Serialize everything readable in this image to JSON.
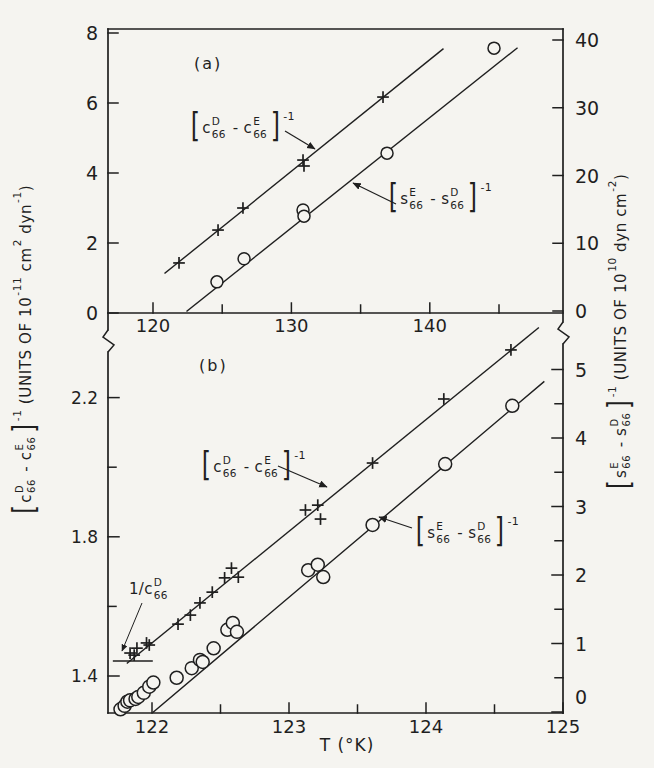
{
  "colors": {
    "paper": "#f5f4f0",
    "ink": "#1f1f1f"
  },
  "titles": {
    "x_axis": "T (°K)",
    "panel_a": "(a)",
    "panel_b": "(b)"
  },
  "formulas": {
    "c_inverse": [
      {
        "br": "["
      },
      {
        "t": "c"
      },
      {
        "stk": [
          "D",
          "66"
        ]
      },
      {
        "t": " - "
      },
      {
        "t": "c"
      },
      {
        "stk": [
          "E",
          "66"
        ]
      },
      {
        "br": "]"
      },
      {
        "sup": "-1"
      }
    ],
    "s_inverse": [
      {
        "br": "["
      },
      {
        "t": "s"
      },
      {
        "stk": [
          "E",
          "66"
        ]
      },
      {
        "t": " - "
      },
      {
        "t": "s"
      },
      {
        "stk": [
          "D",
          "66"
        ]
      },
      {
        "br": "]"
      },
      {
        "sup": "-1"
      }
    ],
    "intercept": [
      {
        "t": "1/c"
      },
      {
        "stk": [
          "D",
          "66"
        ]
      }
    ],
    "left_axis_title": [
      {
        "br": "["
      },
      {
        "t": "c"
      },
      {
        "stk": [
          "D",
          "66"
        ]
      },
      {
        "t": " - "
      },
      {
        "t": "c"
      },
      {
        "stk": [
          "E",
          "66"
        ]
      },
      {
        "br": "]"
      },
      {
        "sup": "-1"
      },
      {
        "t": " (UNITS OF 10"
      },
      {
        "sup": "-11"
      },
      {
        "t": " cm"
      },
      {
        "sup": "2"
      },
      {
        "t": " dyn"
      },
      {
        "sup": "-1"
      },
      {
        "t": ")"
      }
    ],
    "right_axis_title": [
      {
        "br": "["
      },
      {
        "t": "s"
      },
      {
        "stk": [
          "E",
          "66"
        ]
      },
      {
        "t": " - "
      },
      {
        "t": "s"
      },
      {
        "stk": [
          "D",
          "66"
        ]
      },
      {
        "br": "]"
      },
      {
        "sup": "-1"
      },
      {
        "t": " (UNITS OF 10"
      },
      {
        "sup": "10"
      },
      {
        "t": " dyn cm"
      },
      {
        "sup": "-2"
      },
      {
        "t": ")"
      }
    ]
  },
  "chart_data": [
    {
      "panel": "a",
      "type": "scatter",
      "x_label": "T (°K)",
      "x_range": [
        116.8,
        149.6
      ],
      "x_ticks": {
        "major": [
          120,
          130,
          140
        ],
        "labels": [
          "120",
          "130",
          "140"
        ],
        "minor": [
          125,
          135,
          145
        ]
      },
      "left_axis": {
        "quantity": "(c66D - c66E)^-1",
        "units": "10^-11 cm^2 dyn^-1",
        "range": [
          0,
          8.1
        ],
        "ticks": [
          0,
          2,
          4,
          6,
          8
        ],
        "labels": [
          "0",
          "2",
          "4",
          "6",
          "8"
        ],
        "minor": []
      },
      "right_axis": {
        "quantity": "(s66E - s66D)^-1",
        "units": "10^10 dyn cm^-2",
        "range": [
          0,
          41.6
        ],
        "ticks": [
          0,
          10,
          20,
          30,
          40
        ],
        "labels": [
          "0",
          "10",
          "20",
          "30",
          "40"
        ],
        "minor": []
      },
      "series": [
        {
          "name": "(c66D - c66E)^-1",
          "marker": "plus",
          "axis": "left",
          "points": [
            [
              121.88,
              1.43
            ],
            [
              124.7,
              2.37
            ],
            [
              126.5,
              3.0
            ],
            [
              130.84,
              4.37
            ],
            [
              130.91,
              4.2
            ],
            [
              136.62,
              6.17
            ]
          ],
          "fit_line": [
            [
              120.87,
              1.14
            ],
            [
              140.95,
              7.54
            ]
          ]
        },
        {
          "name": "(s66E - s66D)^-1",
          "marker": "circle",
          "axis": "right",
          "points": [
            [
              124.62,
              4.3
            ],
            [
              126.58,
              7.7
            ],
            [
              130.84,
              14.9
            ],
            [
              130.91,
              14.0
            ],
            [
              136.91,
              23.3
            ],
            [
              144.64,
              38.8
            ]
          ],
          "fit_line": [
            [
              122.46,
              0.0
            ],
            [
              146.3,
              38.8
            ]
          ]
        }
      ]
    },
    {
      "panel": "b",
      "type": "scatter",
      "x_label": "T (°K)",
      "x_range": [
        121.69,
        125.0
      ],
      "x_ticks": {
        "major": [
          122,
          123,
          124,
          125
        ],
        "labels": [
          "122",
          "123",
          "124",
          "125"
        ],
        "minor": [
          122.5,
          123.5,
          124.5
        ]
      },
      "left_axis": {
        "quantity": "(c66D - c66E)^-1",
        "units": "10^-11 cm^2 dyn^-1",
        "range": [
          1.29,
          2.39
        ],
        "ticks": [
          1.4,
          1.8,
          2.2
        ],
        "labels": [
          "1.4",
          "1.8",
          "2.2"
        ],
        "minor": [
          1.6,
          2.0
        ]
      },
      "right_axis": {
        "quantity": "(s66E - s66D)^-1",
        "units": "10^10 dyn cm^-2",
        "range": [
          0,
          5.43
        ],
        "ticks": [
          0,
          1,
          2,
          3,
          4,
          5
        ],
        "labels": [
          "0",
          "1",
          "2",
          "3",
          "4",
          "5"
        ],
        "minor": [
          0.5,
          1.5,
          2.5,
          3.5,
          4.5
        ]
      },
      "series": [
        {
          "name": "(c66D - c66E)^-1",
          "marker": "plus",
          "axis": "left",
          "points": [
            [
              121.84,
              1.466
            ],
            [
              121.87,
              1.46
            ],
            [
              121.89,
              1.48
            ],
            [
              121.96,
              1.495
            ],
            [
              121.98,
              1.489
            ],
            [
              122.19,
              1.549
            ],
            [
              122.28,
              1.575
            ],
            [
              122.35,
              1.61
            ],
            [
              122.44,
              1.641
            ],
            [
              122.53,
              1.682
            ],
            [
              122.58,
              1.71
            ],
            [
              122.63,
              1.684
            ],
            [
              123.12,
              1.877
            ],
            [
              123.21,
              1.891
            ],
            [
              123.23,
              1.851
            ],
            [
              123.61,
              2.012
            ],
            [
              124.13,
              2.196
            ],
            [
              124.62,
              2.337
            ]
          ],
          "fit_line": [
            [
              121.82,
              1.437
            ],
            [
              124.82,
              2.4
            ]
          ]
        },
        {
          "name": "(s66E - s66D)^-1",
          "marker": "circle",
          "axis": "right",
          "points": [
            [
              121.77,
              0.04
            ],
            [
              121.8,
              0.09
            ],
            [
              121.82,
              0.15
            ],
            [
              121.84,
              0.17
            ],
            [
              121.88,
              0.19
            ],
            [
              121.9,
              0.22
            ],
            [
              121.94,
              0.28
            ],
            [
              121.98,
              0.37
            ],
            [
              122.01,
              0.43
            ],
            [
              122.18,
              0.5
            ],
            [
              122.29,
              0.64
            ],
            [
              122.35,
              0.76
            ],
            [
              122.37,
              0.73
            ],
            [
              122.45,
              0.93
            ],
            [
              122.55,
              1.2
            ],
            [
              122.59,
              1.3
            ],
            [
              122.62,
              1.17
            ],
            [
              123.14,
              2.07
            ],
            [
              123.21,
              2.15
            ],
            [
              123.25,
              1.97
            ],
            [
              123.61,
              2.73
            ],
            [
              124.14,
              3.62
            ],
            [
              124.63,
              4.47
            ]
          ],
          "fit_line": [
            [
              122.01,
              0.0
            ],
            [
              124.86,
              4.82
            ]
          ]
        }
      ],
      "intercept_marker": {
        "label": "1/c66D",
        "value": 1.443,
        "T_span": [
          121.72,
          122.0
        ]
      }
    }
  ],
  "annotations": {
    "a_c_arrow": [
      285,
      131,
      315,
      149
    ],
    "a_s_arrow": [
      396,
      204,
      353,
      183
    ],
    "b_c_arrow": [
      278,
      466,
      327,
      487
    ],
    "b_s_arrow": [
      412,
      528,
      379,
      517
    ],
    "intercept_pointer": [
      142,
      603,
      122,
      651
    ]
  }
}
